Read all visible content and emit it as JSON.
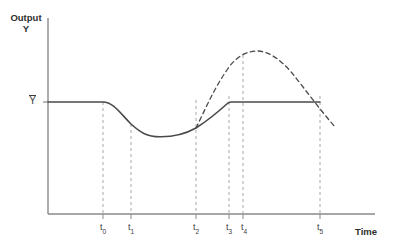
{
  "chart_data": {
    "type": "line",
    "title": "",
    "xlabel": "Time",
    "ylabel": "Output Y",
    "ylabel_line1": "Output",
    "ylabel_line2": "Y",
    "reference_level_label": "Y",
    "reference_level_value": 102,
    "xlim": [
      48,
      375
    ],
    "ylim": [
      214,
      18
    ],
    "grid": false,
    "legend": "none",
    "tick_labels": [
      "t0",
      "t1",
      "t2",
      "t3",
      "t4",
      "t5"
    ],
    "tick_display": [
      "t₀",
      "t₁",
      "t₂",
      "t₃",
      "t₄",
      "t₅"
    ],
    "tick_x_positions": [
      103,
      131,
      196,
      229,
      243,
      320
    ],
    "series": [
      {
        "name": "actual-output",
        "style": "solid",
        "color": "#4a4a4a",
        "description": "Output falls below potential after t0, troughs, recovers to Ybar at t3 and stays flat through t5",
        "points": [
          [
            48,
            102
          ],
          [
            103,
            102
          ],
          [
            112,
            109
          ],
          [
            121,
            117
          ],
          [
            131,
            124
          ],
          [
            142,
            131
          ],
          [
            152,
            135
          ],
          [
            163,
            136
          ],
          [
            174,
            134
          ],
          [
            185,
            130
          ],
          [
            196,
            128
          ],
          [
            207,
            121
          ],
          [
            218,
            112
          ],
          [
            229,
            103
          ],
          [
            232,
            102
          ],
          [
            320,
            102
          ]
        ]
      },
      {
        "name": "potential-output",
        "style": "dashed",
        "color": "#4a4a4a",
        "description": "Hypothetical faster recovery branching at t2, overshooting above Ybar, peaking just after t4 then declining through t5",
        "points": [
          [
            196,
            128
          ],
          [
            203,
            113
          ],
          [
            211,
            96
          ],
          [
            220,
            79
          ],
          [
            229,
            67
          ],
          [
            239,
            57
          ],
          [
            250,
            52
          ],
          [
            261,
            51
          ],
          [
            272,
            53
          ],
          [
            283,
            58
          ],
          [
            294,
            67
          ],
          [
            305,
            80
          ],
          [
            316,
            96
          ],
          [
            326,
            112
          ],
          [
            336,
            128
          ]
        ]
      }
    ],
    "vertical_dashed_lines": [
      {
        "name": "t0",
        "x": 103,
        "y_top": 102,
        "y_bottom": 214
      },
      {
        "name": "t1",
        "x": 131,
        "y_top": 124,
        "y_bottom": 214
      },
      {
        "name": "t2",
        "x": 196,
        "y_top": 100,
        "y_bottom": 214
      },
      {
        "name": "t3",
        "x": 229,
        "y_top": 96,
        "y_bottom": 214
      },
      {
        "name": "t4",
        "x": 243,
        "y_top": 55,
        "y_bottom": 214
      },
      {
        "name": "t5",
        "x": 320,
        "y_top": 96,
        "y_bottom": 214
      }
    ],
    "colors": {
      "axis": "#8a8a8a",
      "curve": "#4a4a4a",
      "dashed_guide": "#a8a8a8",
      "text": "#3a3a3a",
      "title_text": "#2f2f2f",
      "background": "#ffffff"
    }
  }
}
